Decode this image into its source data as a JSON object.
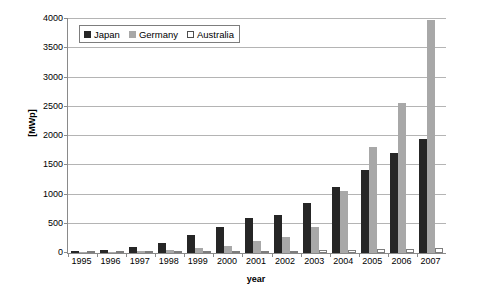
{
  "chart_data": {
    "type": "bar",
    "title": "",
    "subtitle": "",
    "xlabel": "year",
    "ylabel": "[MWp]",
    "categories": [
      "1995",
      "1996",
      "1997",
      "1998",
      "1999",
      "2000",
      "2001",
      "2002",
      "2003",
      "2004",
      "2005",
      "2006",
      "2007"
    ],
    "series": [
      {
        "name": "Japan",
        "color": "#262626",
        "values": [
          40,
          60,
          100,
          170,
          300,
          450,
          600,
          650,
          860,
          1130,
          1420,
          1710,
          1950
        ]
      },
      {
        "name": "Germany",
        "color": "#a8a8a8",
        "values": [
          10,
          20,
          40,
          60,
          80,
          120,
          200,
          280,
          450,
          1060,
          1810,
          2570,
          3980
        ]
      },
      {
        "name": "Australia",
        "color": "#ffffff",
        "values": [
          10,
          12,
          15,
          20,
          25,
          30,
          35,
          40,
          45,
          55,
          65,
          75,
          85
        ]
      }
    ],
    "ylim": [
      0,
      4000
    ],
    "yticks": [
      0,
      500,
      1000,
      1500,
      2000,
      2500,
      3000,
      3500,
      4000
    ],
    "ytick_labels": [
      "0",
      "500",
      "1000",
      "1500",
      "2000",
      "2500",
      "3000",
      "3500",
      "4000"
    ],
    "grid": true,
    "legend_position": "top-left-inside"
  },
  "legend": {
    "items": [
      {
        "label": "Japan",
        "swatch": "legend-swatch-japan"
      },
      {
        "label": "Germany",
        "swatch": "legend-swatch-germany"
      },
      {
        "label": "Australia",
        "swatch": "legend-swatch-australia"
      }
    ]
  },
  "colors": {
    "japan": "#262626",
    "germany": "#a8a8a8",
    "australia": "#ffffff",
    "axis": "#8a8a8a",
    "grid": "#b4b4b4",
    "background": "#ffffff"
  }
}
